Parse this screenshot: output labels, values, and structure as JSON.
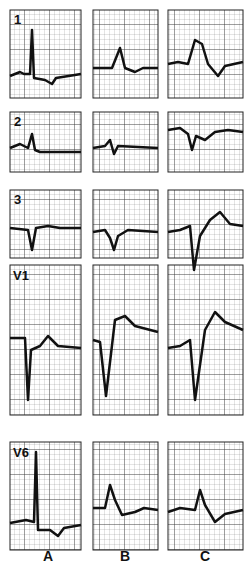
{
  "figure": {
    "leads": [
      "1",
      "2",
      "3",
      "V1",
      "V6"
    ],
    "columns": [
      "A",
      "B",
      "C"
    ],
    "ink_color": "#111111",
    "grid_color": "#555555"
  }
}
